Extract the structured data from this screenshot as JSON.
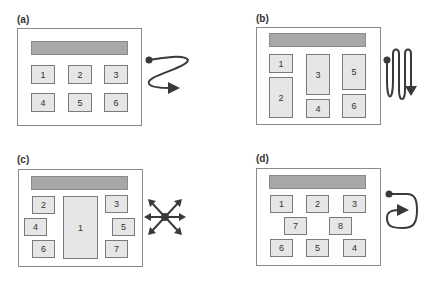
{
  "panels": [
    {
      "label": "(a)",
      "boxes": [
        "1",
        "2",
        "3",
        "4",
        "5",
        "6"
      ],
      "pattern": "z-pattern-icon"
    },
    {
      "label": "(b)",
      "boxes": [
        "1",
        "2",
        "3",
        "4",
        "5",
        "6"
      ],
      "pattern": "vertical-zigzag-icon"
    },
    {
      "label": "(c)",
      "boxes": [
        "1",
        "2",
        "3",
        "4",
        "5",
        "6",
        "7"
      ],
      "pattern": "radial-arrows-icon"
    },
    {
      "label": "(d)",
      "boxes": [
        "1",
        "2",
        "3",
        "7",
        "8",
        "6",
        "5",
        "4"
      ],
      "pattern": "clockwise-loop-icon"
    }
  ],
  "colors": {
    "bar": "#a8a8a8",
    "box": "#e6e6e6",
    "arrow": "#3a3a3a"
  }
}
